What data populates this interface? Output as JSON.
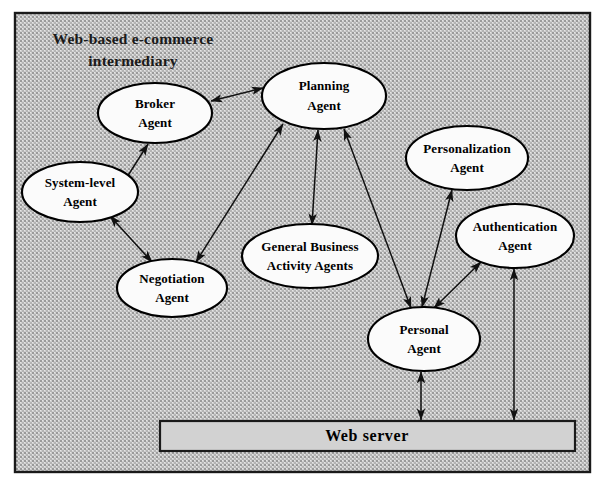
{
  "diagram": {
    "title": "Web-based e-commerce intermediary",
    "title_line1": "Web-based e-commerce",
    "title_line2": "intermediary",
    "frame": {
      "border_color": "#1a1a1a",
      "fill_pattern": "gray-crosshatch-texture",
      "fill_color": "#c8c8c8"
    },
    "nodes": [
      {
        "id": "broker-agent",
        "label": "Broker Agent",
        "line1": "Broker",
        "line2": "Agent",
        "shape": "ellipse",
        "cx": 155,
        "cy": 113,
        "rx": 57,
        "ry": 30,
        "fill": "#fbfbfb"
      },
      {
        "id": "planning-agent",
        "label": "Planning Agent",
        "line1": "Planning",
        "line2": "Agent",
        "shape": "ellipse",
        "cx": 324,
        "cy": 96,
        "rx": 62,
        "ry": 33,
        "fill": "#fbfbfb"
      },
      {
        "id": "system-level-agent",
        "label": "System-level Agent",
        "line1": "System-level",
        "line2": "Agent",
        "shape": "ellipse",
        "cx": 80,
        "cy": 192,
        "rx": 58,
        "ry": 30,
        "fill": "#fbfbfb"
      },
      {
        "id": "negotiation-agent",
        "label": "Negotiation Agent",
        "line1": "Negotiation",
        "line2": "Agent",
        "shape": "ellipse",
        "cx": 172,
        "cy": 288,
        "rx": 55,
        "ry": 29,
        "fill": "#fbfbfb"
      },
      {
        "id": "general-business-activity-agents",
        "label": "General Business Activity Agents",
        "line1": "General Business",
        "line2": "Activity Agents",
        "shape": "ellipse",
        "cx": 310,
        "cy": 256,
        "rx": 68,
        "ry": 32,
        "fill": "#fbfbfb"
      },
      {
        "id": "personalization-agent",
        "label": "Personalization Agent",
        "line1": "Personalization",
        "line2": "Agent",
        "shape": "ellipse",
        "cx": 467,
        "cy": 158,
        "rx": 61,
        "ry": 32,
        "fill": "#fbfbfb"
      },
      {
        "id": "authentication-agent",
        "label": "Authentication Agent",
        "line1": "Authentication",
        "line2": "Agent",
        "shape": "ellipse",
        "cx": 515,
        "cy": 236,
        "rx": 59,
        "ry": 32,
        "fill": "#fbfbfb"
      },
      {
        "id": "personal-agent",
        "label": "Personal Agent",
        "line1": "Personal",
        "line2": "Agent",
        "shape": "ellipse",
        "cx": 424,
        "cy": 339,
        "rx": 56,
        "ry": 32,
        "fill": "#fbfbfb"
      }
    ],
    "server": {
      "id": "web-server",
      "label": "Web server",
      "shape": "rectangle",
      "x": 160,
      "y": 421,
      "width": 415,
      "height": 30,
      "fill": "#d2d2d2",
      "border_color": "#1a1a1a"
    },
    "edges": [
      {
        "id": "broker-planning",
        "from": "broker-agent",
        "to": "planning-agent",
        "direction": "bidirectional"
      },
      {
        "id": "broker-system-level",
        "from": "broker-agent",
        "to": "system-level-agent",
        "direction": "bidirectional"
      },
      {
        "id": "negotiation-system-level",
        "from": "negotiation-agent",
        "to": "system-level-agent",
        "direction": "bidirectional"
      },
      {
        "id": "negotiation-planning",
        "from": "negotiation-agent",
        "to": "planning-agent",
        "direction": "bidirectional"
      },
      {
        "id": "general-business-planning",
        "from": "general-business-activity-agents",
        "to": "planning-agent",
        "direction": "bidirectional"
      },
      {
        "id": "personal-planning",
        "from": "personal-agent",
        "to": "planning-agent",
        "direction": "bidirectional"
      },
      {
        "id": "personal-personalization",
        "from": "personal-agent",
        "to": "personalization-agent",
        "direction": "bidirectional"
      },
      {
        "id": "personal-authentication",
        "from": "personal-agent",
        "to": "authentication-agent",
        "direction": "bidirectional"
      },
      {
        "id": "personal-web-server",
        "from": "personal-agent",
        "to": "web-server",
        "direction": "bidirectional"
      },
      {
        "id": "authentication-web-server",
        "from": "authentication-agent",
        "to": "web-server",
        "direction": "bidirectional"
      }
    ]
  }
}
